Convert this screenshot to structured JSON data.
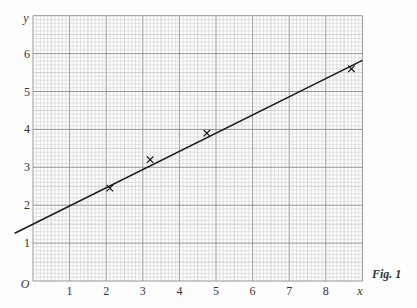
{
  "chart_data": {
    "type": "scatter",
    "title": "",
    "caption": "Fig. 1",
    "xlabel": "x",
    "ylabel": "y",
    "origin_label": "O",
    "xlim": [
      0,
      9
    ],
    "ylim": [
      0,
      7
    ],
    "xticks": [
      "1",
      "2",
      "3",
      "4",
      "5",
      "6",
      "7",
      "8"
    ],
    "yticks": [
      "1",
      "2",
      "3",
      "4",
      "5",
      "6"
    ],
    "grid": true,
    "points": [
      {
        "x": 2.1,
        "y": 2.45
      },
      {
        "x": 3.2,
        "y": 3.2
      },
      {
        "x": 4.75,
        "y": 3.9
      },
      {
        "x": 8.7,
        "y": 5.6
      }
    ],
    "fit_line": {
      "intercept": 1.5,
      "slope": 0.48,
      "x_start": -0.5,
      "x_end": 9.0
    },
    "marker": "x",
    "colors": {
      "grid_major": "#8a8a8a",
      "grid_minor": "#c8c8c8",
      "line": "#1a1a1a",
      "marker": "#1a1a1a"
    }
  }
}
